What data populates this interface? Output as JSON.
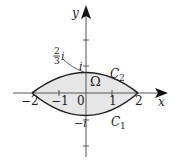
{
  "diagram": {
    "axes": {
      "x_label": "x",
      "y_label": "y",
      "x_ticks": [
        "−2",
        "−1",
        "0",
        "1",
        "2"
      ],
      "y_ticks_upper": "i",
      "y_ticks_lower": "−i"
    },
    "region_label": "Ω",
    "curves": [
      {
        "name": "C2",
        "label": "C",
        "sub": "2",
        "position": "upper"
      },
      {
        "name": "C1",
        "label": "C",
        "sub": "1",
        "position": "lower"
      }
    ],
    "annotation": {
      "numerator": "2",
      "denominator": "3",
      "suffix": "i"
    },
    "colors": {
      "region_fill": "#e6e6e6",
      "stroke": "#222222"
    }
  }
}
